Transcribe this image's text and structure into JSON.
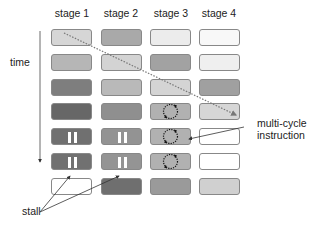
{
  "diagram": {
    "stages": [
      "stage 1",
      "stage 2",
      "stage 3",
      "stage 4"
    ],
    "time_label": "time",
    "stall_label": "stall",
    "multicycle_label_line1": "multi-cycle",
    "multicycle_label_line2": "instruction",
    "rows": [
      [
        {
          "fill": "#d6d6d6"
        },
        {
          "fill": "#a9a9a9"
        },
        {
          "fill": "#ececec"
        },
        {
          "fill": "#f8f8f8"
        }
      ],
      [
        {
          "fill": "#b6b6b6"
        },
        {
          "fill": "#d3d3d3"
        },
        {
          "fill": "#a2a2a2"
        },
        {
          "fill": "#efefef"
        }
      ],
      [
        {
          "fill": "#7e7e7e"
        },
        {
          "fill": "#b9b9b9"
        },
        {
          "fill": "#d4d4d4"
        },
        {
          "fill": "#a0a0a0"
        }
      ],
      [
        {
          "fill": "#676767"
        },
        {
          "fill": "#8f8f8f"
        },
        {
          "fill": "#b1b1b1",
          "marker": "cycle"
        },
        {
          "fill": "#d6d6d6"
        }
      ],
      [
        {
          "fill": "#707070",
          "marker": "stall"
        },
        {
          "fill": "#939393",
          "marker": "stall"
        },
        {
          "fill": "#b1b1b1",
          "marker": "cycle"
        },
        {
          "fill": "#ffffff"
        }
      ],
      [
        {
          "fill": "#717171",
          "marker": "stall"
        },
        {
          "fill": "#949494",
          "marker": "stall"
        },
        {
          "fill": "#b1b1b1",
          "marker": "cycle"
        },
        {
          "fill": "#ffffff"
        }
      ],
      [
        {
          "fill": "#ffffff"
        },
        {
          "fill": "#6f6f6f"
        },
        {
          "fill": "#9a9a9a"
        },
        {
          "fill": "#d0d0d0"
        }
      ]
    ]
  }
}
